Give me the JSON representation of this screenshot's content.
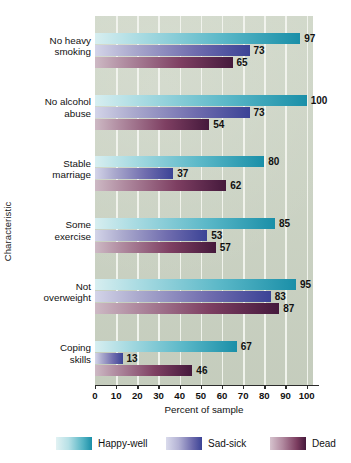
{
  "chart_data": {
    "type": "bar",
    "orientation": "horizontal",
    "title": "",
    "xlabel": "Percent of sample",
    "ylabel": "Characteristic",
    "xlim": [
      0,
      103
    ],
    "xticks": [
      0,
      10,
      20,
      30,
      40,
      50,
      60,
      70,
      80,
      90,
      100
    ],
    "grid": "vertical-white-gridlines",
    "legend_position": "bottom",
    "categories": [
      "No heavy smoking",
      "No alcohol abuse",
      "Stable marriage",
      "Some exercise",
      "Not overweight",
      "Coping skills"
    ],
    "series": [
      {
        "name": "Happy-well",
        "color": "#1a8fa8",
        "values": [
          97,
          100,
          80,
          85,
          95,
          67
        ]
      },
      {
        "name": "Sad-sick",
        "color": "#3b4396",
        "values": [
          73,
          73,
          37,
          53,
          83,
          13
        ]
      },
      {
        "name": "Dead",
        "color": "#45193c",
        "values": [
          65,
          54,
          62,
          57,
          87,
          46
        ]
      }
    ],
    "plot_background": "#ccd4c4",
    "gridline_color": "#f2f4ee"
  },
  "axis": {
    "x_title": "Percent of sample",
    "y_title": "Characteristic",
    "x_tick_labels": [
      "0",
      "10",
      "20",
      "30",
      "40",
      "50",
      "60",
      "70",
      "80",
      "90",
      "100"
    ]
  },
  "categories": [
    {
      "line1": "No heavy",
      "line2": "smoking"
    },
    {
      "line1": "No alcohol",
      "line2": "abuse"
    },
    {
      "line1": "Stable",
      "line2": "marriage"
    },
    {
      "line1": "Some",
      "line2": "exercise"
    },
    {
      "line1": "Not",
      "line2": "overweight"
    },
    {
      "line1": "Coping",
      "line2": "skills"
    }
  ],
  "legend": {
    "items": [
      {
        "label": "Happy-well",
        "key": "happy"
      },
      {
        "label": "Sad-sick",
        "key": "sad"
      },
      {
        "label": "Dead",
        "key": "dead"
      }
    ]
  }
}
